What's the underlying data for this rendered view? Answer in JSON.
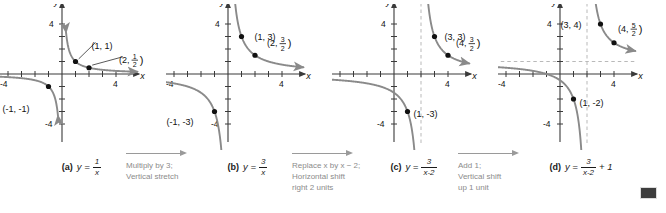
{
  "figure": {
    "background_color": "#ffffff",
    "curve_color": "#8a8a8a",
    "axis_color": "#3a3a3a",
    "point_color": "#111111",
    "asymptote_color": "#b9b9b9",
    "annotation_color": "#8b8b8b",
    "end_marker_color": "#3d3d3d"
  },
  "axes": {
    "x_label": "x",
    "y_label": "y",
    "tick_pos_label": "4",
    "tick_neg_label": "-4",
    "x_min": -5.2,
    "x_max": 5.2,
    "y_min": -5.2,
    "y_max": 5.2,
    "ticks": [
      -4,
      -3,
      -2,
      -1,
      1,
      2,
      3,
      4
    ],
    "labeled_ticks": [
      -4,
      4
    ]
  },
  "panels": [
    {
      "letter": "(a)",
      "equation_plain": "y = 1/x",
      "eq_lhs": "y =",
      "eq_numerator": "1",
      "eq_denominator": "x",
      "eq_tail": "",
      "function": "1/x",
      "shown_x_tick": "4",
      "shown_neg_x_tick": "-4",
      "shown_y_tick": "4",
      "shown_neg_y_tick": "-4",
      "vertical_asymptote": null,
      "horizontal_asymptote": null,
      "points": [
        {
          "label": "(1, 1)",
          "x": 1,
          "y": 1,
          "label_dx": 16,
          "label_dy": -22,
          "leader": true,
          "frac": null
        },
        {
          "label": "(2, 1/2)",
          "x": 2,
          "y": 0.5,
          "label_dx": 30,
          "label_dy": -14,
          "leader": true,
          "frac": {
            "prefix": "(2,",
            "num": "1",
            "den": "2",
            "suffix": ")"
          }
        },
        {
          "label": "(-1, -1)",
          "x": -1,
          "y": -1,
          "label_dx": -46,
          "label_dy": 16,
          "leader": false,
          "frac": null
        }
      ]
    },
    {
      "letter": "(b)",
      "equation_plain": "y = 3/x",
      "eq_lhs": "y =",
      "eq_numerator": "3",
      "eq_denominator": "x",
      "eq_tail": "",
      "function": "3/x",
      "shown_x_tick": "4",
      "shown_neg_x_tick": "-4",
      "shown_y_tick": "4",
      "shown_neg_y_tick": "-4",
      "vertical_asymptote": null,
      "horizontal_asymptote": null,
      "points": [
        {
          "label": "(1, 3)",
          "x": 1,
          "y": 3,
          "label_dx": 13,
          "label_dy": -6,
          "leader": false,
          "frac": null
        },
        {
          "label": "(2, 3/2)",
          "x": 2,
          "y": 1.5,
          "label_dx": 12,
          "label_dy": -18,
          "leader": false,
          "frac": {
            "prefix": "(2,",
            "num": "3",
            "den": "2",
            "suffix": ")"
          }
        },
        {
          "label": "(-1, -3)",
          "x": -1,
          "y": -3,
          "label_dx": -48,
          "label_dy": 4,
          "leader": false,
          "frac": null
        }
      ]
    },
    {
      "letter": "(c)",
      "equation_plain": "y = 3/(x-2)",
      "eq_lhs": "y =",
      "eq_numerator": "3",
      "eq_denominator": "x-2",
      "eq_tail": "",
      "function": "3/(x-2)",
      "shown_x_tick": "4",
      "shown_neg_x_tick": "",
      "shown_y_tick": "4",
      "shown_neg_y_tick": "-4",
      "vertical_asymptote": 2,
      "horizontal_asymptote": null,
      "points": [
        {
          "label": "(3, 3)",
          "x": 3,
          "y": 3,
          "label_dx": 10,
          "label_dy": -6,
          "leader": false,
          "frac": null
        },
        {
          "label": "(4, 3/2)",
          "x": 4,
          "y": 1.5,
          "label_dx": 8,
          "label_dy": -18,
          "leader": false,
          "frac": {
            "prefix": "(4,",
            "num": "3",
            "den": "2",
            "suffix": ")"
          }
        },
        {
          "label": "(1, -3)",
          "x": 1,
          "y": -3,
          "label_dx": 6,
          "label_dy": -4,
          "leader": false,
          "frac": null
        }
      ]
    },
    {
      "letter": "(d)",
      "equation_plain": "y = 3/(x-2) + 1",
      "eq_lhs": "y =",
      "eq_numerator": "3",
      "eq_denominator": "x-2",
      "eq_tail": "+ 1",
      "function": "3/(x-2)+1",
      "shown_x_tick": "4",
      "shown_neg_x_tick": "-4",
      "shown_y_tick": "4",
      "shown_neg_y_tick": "-4",
      "vertical_asymptote": 2,
      "horizontal_asymptote": 1,
      "points": [
        {
          "label": "(3, 4)",
          "x": 3,
          "y": 4,
          "label_dx": -40,
          "label_dy": -5,
          "leader": false,
          "frac": null
        },
        {
          "label": "(4, 5/2)",
          "x": 4,
          "y": 2.5,
          "label_dx": 4,
          "label_dy": -20,
          "leader": false,
          "frac": {
            "prefix": "(4,",
            "num": "5",
            "den": "2",
            "suffix": ")"
          }
        },
        {
          "label": "(1, -2)",
          "x": 1,
          "y": -2,
          "label_dx": 6,
          "label_dy": -2,
          "leader": false,
          "frac": null
        }
      ]
    }
  ],
  "transitions": [
    {
      "line1": "Multiply by 3;",
      "line2": "Vertical stretch",
      "line3": ""
    },
    {
      "line1": "Replace x by x − 2;",
      "line2": "Horizontal shift",
      "line3": "right 2 units"
    },
    {
      "line1": "Add 1;",
      "line2": "Vertical shift",
      "line3": "up 1 unit"
    }
  ]
}
